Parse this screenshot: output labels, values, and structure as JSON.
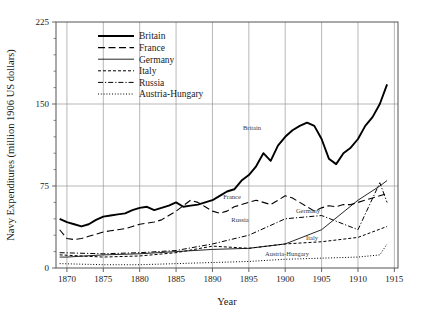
{
  "chart_data": {
    "type": "line",
    "title": "",
    "xlabel": "Year",
    "ylabel": "Navy Expenditures (million 1906 US dollars)",
    "xlim": [
      1868.5,
      1915.5
    ],
    "ylim": [
      0,
      225
    ],
    "xticks": [
      1870,
      1875,
      1880,
      1885,
      1890,
      1895,
      1900,
      1905,
      1910,
      1915
    ],
    "yticks": [
      0,
      75,
      150,
      225
    ],
    "yticks_minor": [
      15,
      30,
      45,
      60,
      90,
      105,
      120,
      135,
      165,
      180,
      195,
      210
    ],
    "grid": "major vertical at every 5 years, horizontal at 75 and 150",
    "legend_position": "upper left inside axes",
    "series": [
      {
        "name": "Britain",
        "style": "solid-thick",
        "inline_label": "Britain",
        "x": [
          1869,
          1870,
          1871,
          1872,
          1873,
          1874,
          1875,
          1876,
          1877,
          1878,
          1879,
          1880,
          1881,
          1882,
          1883,
          1884,
          1885,
          1886,
          1887,
          1888,
          1889,
          1890,
          1891,
          1892,
          1893,
          1894,
          1895,
          1896,
          1897,
          1898,
          1899,
          1900,
          1901,
          1902,
          1903,
          1904,
          1905,
          1906,
          1907,
          1908,
          1909,
          1910,
          1911,
          1912,
          1913,
          1914
        ],
        "values": [
          45,
          42,
          40,
          38,
          40,
          44,
          47,
          48,
          49,
          50,
          53,
          55,
          56,
          53,
          55,
          57,
          60,
          56,
          57,
          58,
          60,
          62,
          66,
          70,
          72,
          80,
          85,
          93,
          105,
          98,
          112,
          120,
          126,
          130,
          133,
          130,
          118,
          100,
          95,
          105,
          110,
          118,
          130,
          138,
          150,
          168
        ]
      },
      {
        "name": "France",
        "style": "long-dash",
        "inline_label": "France",
        "x": [
          1869,
          1870,
          1871,
          1872,
          1873,
          1874,
          1875,
          1876,
          1877,
          1878,
          1879,
          1880,
          1881,
          1882,
          1883,
          1884,
          1885,
          1886,
          1887,
          1888,
          1889,
          1890,
          1891,
          1892,
          1893,
          1894,
          1895,
          1896,
          1897,
          1898,
          1899,
          1900,
          1901,
          1902,
          1903,
          1904,
          1905,
          1906,
          1907,
          1908,
          1909,
          1910,
          1911,
          1912,
          1913,
          1914
        ],
        "x_vals": [
          1869,
          1915
        ],
        "values": [
          35,
          27,
          26,
          27,
          29,
          31,
          33,
          34,
          35,
          36,
          38,
          40,
          41,
          42,
          44,
          48,
          52,
          57,
          62,
          60,
          56,
          52,
          50,
          52,
          56,
          58,
          60,
          62,
          60,
          58,
          62,
          66,
          64,
          60,
          56,
          52,
          55,
          57,
          56,
          58,
          58,
          60,
          62,
          64,
          66,
          68
        ]
      },
      {
        "name": "Germany",
        "style": "solid-thin",
        "inline_label": "Germany",
        "x": [
          1869,
          1870,
          1875,
          1880,
          1885,
          1890,
          1895,
          1900,
          1905,
          1910,
          1913,
          1914
        ],
        "values": [
          10,
          10,
          12,
          13,
          15,
          17,
          18,
          22,
          35,
          62,
          75,
          80
        ]
      },
      {
        "name": "Italy",
        "style": "short-dash",
        "inline_label": "Italy",
        "x": [
          1869,
          1875,
          1880,
          1885,
          1890,
          1895,
          1900,
          1905,
          1910,
          1914
        ],
        "values": [
          12,
          10,
          11,
          14,
          20,
          18,
          22,
          24,
          28,
          38
        ]
      },
      {
        "name": "Russia",
        "style": "dash-dot",
        "inline_label": "Russia",
        "x": [
          1869,
          1875,
          1880,
          1885,
          1890,
          1895,
          1900,
          1905,
          1910,
          1913,
          1914
        ],
        "values": [
          14,
          13,
          14,
          16,
          22,
          30,
          45,
          48,
          35,
          78,
          60
        ]
      },
      {
        "name": "Austria-Hungary",
        "style": "dotted",
        "inline_label": "Austria-Hungary",
        "x": [
          1869,
          1875,
          1880,
          1885,
          1890,
          1895,
          1900,
          1905,
          1910,
          1913,
          1914
        ],
        "values": [
          4,
          3,
          3,
          4,
          5,
          6,
          8,
          9,
          10,
          12,
          22
        ]
      }
    ]
  },
  "axes": {
    "ylabel": "Navy Expenditures (million 1906 US dollars)",
    "xlabel": "Year",
    "ytick_labels": [
      "0",
      "75",
      "150",
      "225"
    ],
    "xtick_labels": [
      "1870",
      "1875",
      "1880",
      "1885",
      "1890",
      "1895",
      "1900",
      "1905",
      "1910",
      "1915"
    ]
  },
  "legend": {
    "entries": [
      {
        "label": "Britain",
        "style": "solid-thick"
      },
      {
        "label": "France",
        "style": "long-dash"
      },
      {
        "label": "Germany",
        "style": "solid-thin"
      },
      {
        "label": "Italy",
        "style": "short-dash"
      },
      {
        "label": "Russia",
        "style": "dash-dot"
      },
      {
        "label": "Austria-Hungary",
        "style": "dotted"
      }
    ]
  },
  "inline_labels": [
    {
      "text": "Britain",
      "x": 252,
      "y": 130
    },
    {
      "text": "France",
      "x": 232,
      "y": 199
    },
    {
      "text": "Russia",
      "x": 240,
      "y": 222
    },
    {
      "text": "Germany",
      "x": 308,
      "y": 213
    },
    {
      "text": "Italy",
      "x": 312,
      "y": 240
    },
    {
      "text": "Austria-Hungary",
      "x": 287,
      "y": 256
    }
  ],
  "colors": {
    "line": "#000000",
    "grid": "#9a9a9a",
    "axis": "#555555",
    "background": "#ffffff"
  }
}
